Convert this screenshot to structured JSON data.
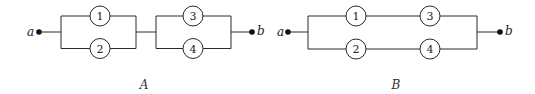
{
  "diagrams": [
    {
      "caption": "A",
      "description": "Components 1 and 2 in parallel, in series with components 3 and 4 in parallel",
      "start_label": "a",
      "end_label": "b",
      "components": [
        "1",
        "2",
        "3",
        "4"
      ]
    },
    {
      "caption": "B",
      "description": "Components 1 and 3 in series, in parallel with components 2 and 4 in series",
      "start_label": "a",
      "end_label": "b",
      "components": [
        "1",
        "3",
        "2",
        "4"
      ]
    }
  ],
  "colors": {
    "line": "#2a2a2a",
    "background": "#ffffff"
  }
}
